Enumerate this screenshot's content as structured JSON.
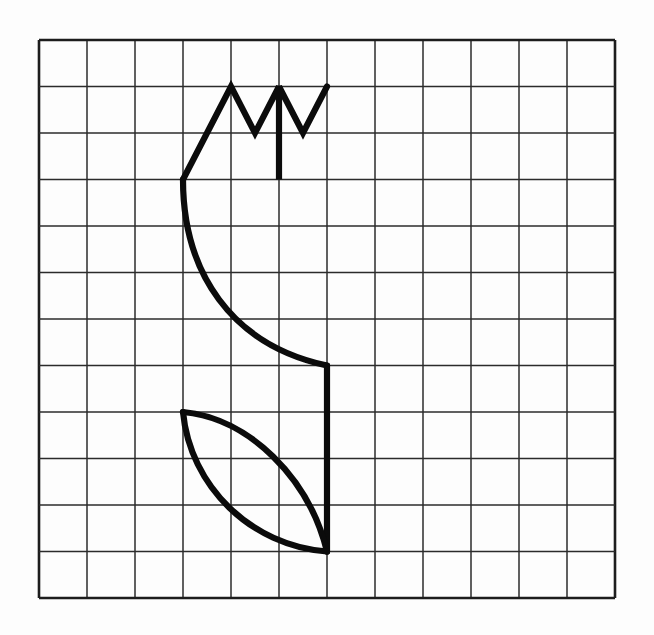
{
  "page": {
    "background_color": "#fdfdfd",
    "width": 654,
    "height": 635
  },
  "grid": {
    "name": "square-grid",
    "columns": 12,
    "rows": 12,
    "origin_x": 39,
    "origin_y": 40,
    "cell_width": 48,
    "cell_height": 46.5,
    "line_color": "#2b2b2b",
    "line_width": 1.5,
    "border_color": "#1d1d1d",
    "border_width": 2.6
  },
  "drawing": {
    "name": "tulip-figure",
    "stroke_color": "#0b0b0b",
    "stroke_width": 6.2,
    "parts": [
      {
        "name": "flower-zigzag-petals",
        "type": "polyline",
        "points": "183,179.5 231,86.5 255,133 279,86.5 279,179.5 279,86.5 303,133 327,86.5"
      },
      {
        "name": "flower-left-curve-to-stem",
        "type": "path",
        "d": "M 183,179.5 C 183,272 231,345 327,365.5"
      },
      {
        "name": "stem",
        "type": "line",
        "d": "M 327,365.5 L 327,551.5"
      },
      {
        "name": "leaf-upper-edge",
        "type": "path",
        "d": "M 183,412 C 249,418 309,478 327,551.5"
      },
      {
        "name": "leaf-lower-edge",
        "type": "path",
        "d": "M 183,412 C 190,486 251,546 327,551.5"
      }
    ]
  },
  "chart_data": {
    "type": "line",
    "xlabel": "",
    "ylabel": "",
    "grid": true,
    "legend": "none",
    "x_ticks": [
      0,
      1,
      2,
      3,
      4,
      5,
      6,
      7,
      8,
      9,
      10,
      11,
      12
    ],
    "y_ticks": [
      0,
      1,
      2,
      3,
      4,
      5,
      6,
      7,
      8,
      9,
      10,
      11,
      12
    ],
    "xlim": [
      0,
      12
    ],
    "ylim": [
      0,
      12
    ],
    "series": [
      {
        "name": "flower-zigzag-petals",
        "x": [
          3,
          4,
          4.5,
          5,
          5,
          5,
          5.5,
          6
        ],
        "y": [
          9,
          11,
          10,
          11,
          9,
          11,
          10,
          11
        ]
      },
      {
        "name": "flower-left-curve-to-stem",
        "x": [
          3,
          3,
          4,
          6
        ],
        "y": [
          9,
          7,
          5.5,
          5
        ]
      },
      {
        "name": "stem",
        "x": [
          6,
          6
        ],
        "y": [
          5,
          1
        ]
      },
      {
        "name": "leaf-upper-edge",
        "x": [
          3,
          4.4,
          5.6,
          6
        ],
        "y": [
          4,
          3.9,
          2.6,
          1
        ]
      },
      {
        "name": "leaf-lower-edge",
        "x": [
          3,
          3.1,
          4.4,
          6
        ],
        "y": [
          4,
          2.4,
          1.1,
          1
        ]
      }
    ]
  }
}
